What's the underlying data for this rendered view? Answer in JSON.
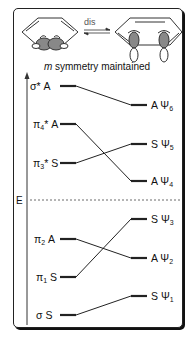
{
  "header": {
    "reaction_label": "dis",
    "caption_symbol": "m",
    "caption_text": " symmetry maintained"
  },
  "axis": {
    "label": "E"
  },
  "left_levels": [
    {
      "orbital": "σ*",
      "sub": "",
      "sym": "A",
      "y": 86
    },
    {
      "orbital": "π",
      "sub": "4",
      "star": "*",
      "sym": "A",
      "y": 124
    },
    {
      "orbital": "π",
      "sub": "3",
      "star": "*",
      "sym": "S",
      "y": 163
    },
    {
      "orbital": "π",
      "sub": "2",
      "star": "",
      "sym": "A",
      "y": 239
    },
    {
      "orbital": "π",
      "sub": "1",
      "star": "",
      "sym": "S",
      "y": 277
    },
    {
      "orbital": "σ",
      "sub": "",
      "star": "",
      "sym": "S",
      "y": 315
    }
  ],
  "right_levels": [
    {
      "sym": "A",
      "psi": "Ψ",
      "sub": "6",
      "y": 105
    },
    {
      "sym": "S",
      "psi": "Ψ",
      "sub": "5",
      "y": 144
    },
    {
      "sym": "A",
      "psi": "Ψ",
      "sub": "4",
      "y": 181
    },
    {
      "sym": "S",
      "psi": "Ψ",
      "sub": "3",
      "y": 219
    },
    {
      "sym": "A",
      "psi": "Ψ",
      "sub": "2",
      "y": 258
    },
    {
      "sym": "S",
      "psi": "Ψ",
      "sub": "1",
      "y": 296
    }
  ],
  "correlations": [
    {
      "from": "σ* A",
      "to": "A Ψ6"
    },
    {
      "from": "π4* A",
      "to": "A Ψ4"
    },
    {
      "from": "π3* S",
      "to": "S Ψ5"
    },
    {
      "from": "π2 A",
      "to": "A Ψ2"
    },
    {
      "from": "π1 S",
      "to": "S Ψ3"
    },
    {
      "from": "σ S",
      "to": "S Ψ1"
    }
  ],
  "labels": {
    "l0_orb": "σ* ",
    "l0_sym": "A",
    "l1_orb": "π",
    "l1_sub": "4",
    "l1_rest": "* A",
    "l2_orb": "π",
    "l2_sub": "3",
    "l2_rest": "* S",
    "l3_orb": "π",
    "l3_sub": "2",
    "l3_rest": " A",
    "l4_orb": "π",
    "l4_sub": "1",
    "l4_rest": " S",
    "l5_orb": "σ ",
    "l5_sym": "S",
    "r0_sym": "A  Ψ",
    "r0_sub": "6",
    "r1_sym": "S  Ψ",
    "r1_sub": "5",
    "r2_sym": "A  Ψ",
    "r2_sub": "4",
    "r3_sym": "S  Ψ",
    "r3_sub": "3",
    "r4_sym": "A  Ψ",
    "r4_sub": "2",
    "r5_sym": "S  Ψ",
    "r5_sub": "1"
  }
}
